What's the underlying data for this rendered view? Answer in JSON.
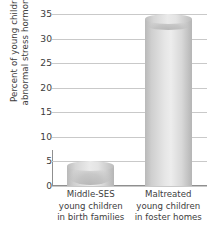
{
  "chart_data": {
    "type": "bar",
    "title": "",
    "xlabel": "",
    "ylabel": "Percent of young children with abnormal stress hormone levels",
    "ylabel_lines": [
      "Percent of young children with",
      "abnormal stress hormone levels"
    ],
    "categories": [
      "Middle-SES young children in birth families",
      "Maltreated young children in foster homes"
    ],
    "category_lines": [
      [
        "Middle-SES",
        "young children",
        "in birth families"
      ],
      [
        "Maltreated",
        "young children",
        "in foster homes"
      ]
    ],
    "values": [
      4,
      34
    ],
    "ylim": [
      0,
      35
    ],
    "yticks": [
      0,
      5,
      10,
      15,
      20,
      25,
      30,
      35
    ],
    "ytick_labels": [
      "0",
      "5",
      "10",
      "15",
      "20",
      "25",
      "30",
      "35"
    ],
    "grid": true,
    "legend": false,
    "bar_style": "cylinder-3d",
    "colors": {
      "bar_light": "#ededed",
      "bar_mid": "#d2d2d2",
      "bar_dark": "#b5b5b5",
      "gridline": "#c9c9c9",
      "axis": "#8f8f8f",
      "text": "#3d3d3d",
      "background": "#ffffff"
    }
  }
}
